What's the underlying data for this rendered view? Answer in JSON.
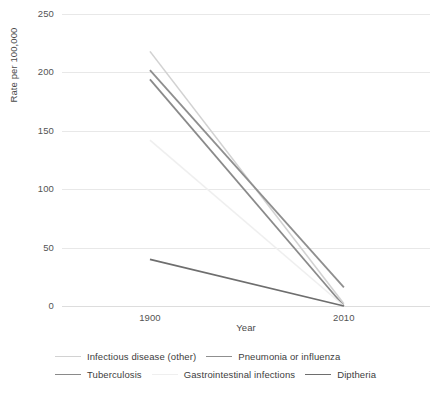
{
  "chart_data": {
    "type": "line",
    "title": "",
    "xlabel": "Year",
    "ylabel": "Rate per 100,000",
    "x": [
      "1900",
      "2010"
    ],
    "categories": [
      "1900",
      "2010"
    ],
    "xtick_labels": [
      "1900",
      "2010"
    ],
    "ytick_labels": [
      "0",
      "50",
      "100",
      "150",
      "200",
      "250"
    ],
    "ytick_values": [
      0,
      50,
      100,
      150,
      200,
      250
    ],
    "ylim": [
      0,
      250
    ],
    "grid": "horizontal",
    "legend_position": "bottom",
    "series": [
      {
        "name": "Infectious disease (other)",
        "values": [
          218,
          2
        ],
        "color": "#d2d2d2",
        "width": 1.6
      },
      {
        "name": "Pneumonia or influenza",
        "values": [
          202,
          16
        ],
        "color": "#8f8f8f",
        "width": 1.8
      },
      {
        "name": "Tuberculosis",
        "values": [
          194,
          0
        ],
        "color": "#8a8a8a",
        "width": 1.8
      },
      {
        "name": "Gastrointestinal infections",
        "values": [
          142,
          0
        ],
        "color": "#efefef",
        "width": 1.6
      },
      {
        "name": "Diptheria",
        "values": [
          40,
          0
        ],
        "color": "#6e6e6e",
        "width": 1.8
      }
    ]
  },
  "axes": {
    "y_title": "Rate per 100,000",
    "x_title": "Year"
  }
}
